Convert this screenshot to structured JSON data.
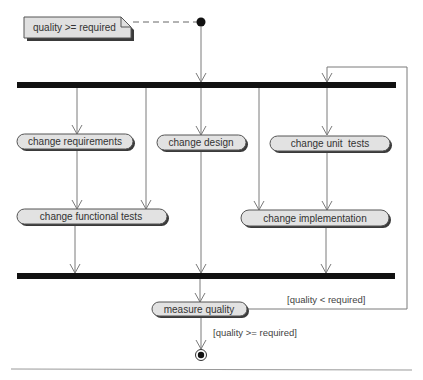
{
  "diagram": {
    "type": "UML activity diagram",
    "note": {
      "text": "quality >= required"
    },
    "actions": [
      {
        "id": "change-requirements",
        "label": "change requirements"
      },
      {
        "id": "change-design",
        "label": "change design"
      },
      {
        "id": "change-unit-tests",
        "label": "change unit  tests"
      },
      {
        "id": "change-functional-tests",
        "label": "change functional tests"
      },
      {
        "id": "change-implementation",
        "label": "change implementation"
      },
      {
        "id": "measure-quality",
        "label": "measure quality"
      }
    ],
    "guards": {
      "loop": "[quality < required]",
      "exit": "[quality >= required]"
    },
    "nodes": {
      "initial": "initial-node",
      "final": "final-node",
      "fork": "fork-bar",
      "join": "join-bar"
    },
    "colors": {
      "bar": "#111111",
      "action_fill": "#e2e2e2",
      "action_border": "#555555",
      "shadow": "#3a3a3a",
      "edge": "#7a7a7a"
    }
  }
}
